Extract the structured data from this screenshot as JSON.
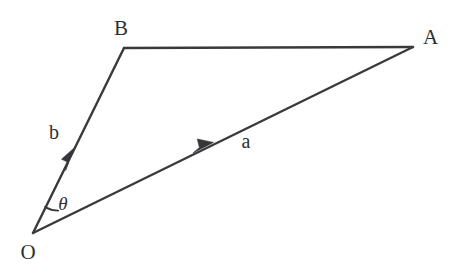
{
  "figure": {
    "type": "vector-triangle-diagram",
    "background_color": "#ffffff",
    "stroke_color": "#3a3a3c",
    "label_color": "#2f2f33",
    "points": {
      "O": {
        "label": "O",
        "x": 33,
        "y": 233,
        "label_x": 28,
        "label_y": 259
      },
      "A": {
        "label": "A",
        "x": 413,
        "y": 47,
        "label_x": 423,
        "label_y": 44
      },
      "B": {
        "label": "B",
        "x": 124,
        "y": 48,
        "label_x": 121,
        "label_y": 35
      }
    },
    "vectors": [
      {
        "name": "a",
        "label": "a",
        "from": "O",
        "to": "A",
        "label_x": 246,
        "label_y": 148,
        "arrow_x": 210,
        "arrow_y": 145
      },
      {
        "name": "b",
        "label": "b",
        "from": "O",
        "to": "B",
        "label_x": 54,
        "label_y": 139,
        "arrow_x": 72,
        "arrow_y": 153
      }
    ],
    "segments": [
      {
        "name": "segment-OA",
        "x1": 33,
        "y1": 233,
        "x2": 413,
        "y2": 47
      },
      {
        "name": "segment-OB",
        "x1": 33,
        "y1": 233,
        "x2": 124,
        "y2": 48
      },
      {
        "name": "segment-BA",
        "x1": 124,
        "y1": 48,
        "x2": 413,
        "y2": 47
      }
    ],
    "angle": {
      "name": "theta",
      "label": "θ",
      "vertex": "O",
      "label_x": 63,
      "label_y": 210,
      "arc_path": "M 58.2 210.6 A 27.5 27.5 0 0 1 45.1 207.1"
    }
  }
}
